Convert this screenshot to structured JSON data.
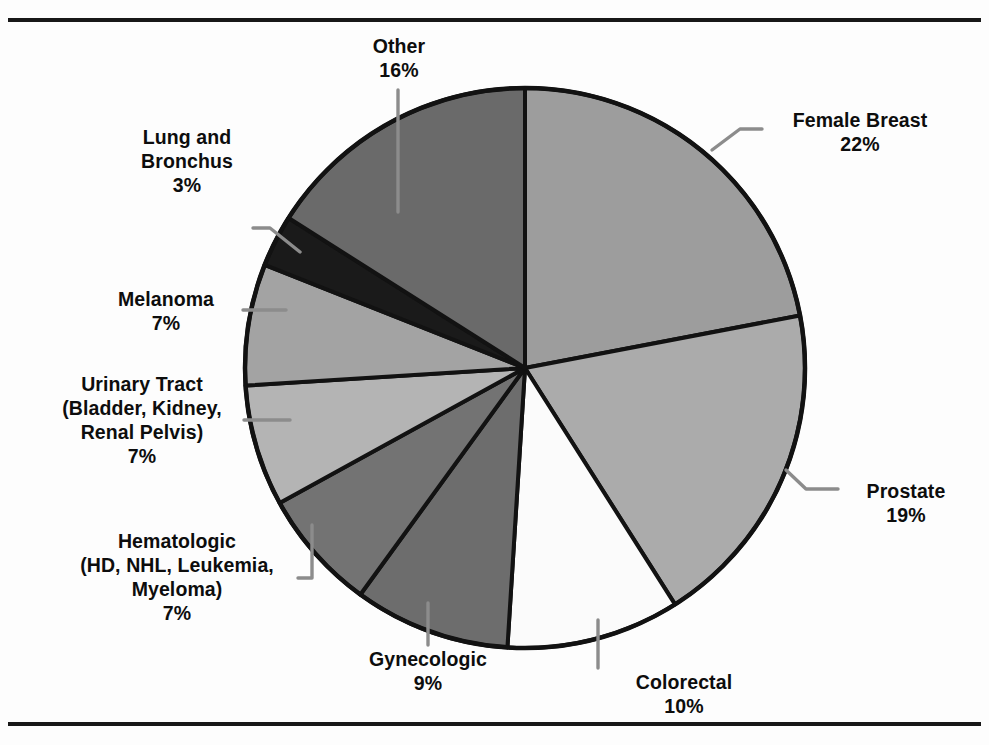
{
  "figure": {
    "frame_color": "#181818",
    "background": "#fdfdfd"
  },
  "chart_data": {
    "type": "pie",
    "title": "",
    "subtitle": "",
    "xlabel": "",
    "ylabel": "",
    "legend_position": "callout-labels",
    "grid": false,
    "units": "percent",
    "total": 100,
    "start_angle_deg": 0,
    "direction": "clockwise",
    "categories": [
      "Female Breast",
      "Prostate",
      "Colorectal",
      "Gynecologic",
      "Hematologic (HD, NHL, Leukemia, Myeloma)",
      "Urinary Tract (Bladder, Kidney, Renal Pelvis)",
      "Melanoma",
      "Lung and Bronchus",
      "Other"
    ],
    "values": [
      22,
      19,
      10,
      9,
      7,
      7,
      7,
      3,
      16
    ],
    "slices": [
      {
        "name": "Female Breast",
        "label_line1": "Female Breast",
        "label_line2": "",
        "label_line3": "",
        "percent_label": "22%",
        "value": 22,
        "fill": "#9d9d9d",
        "leader": true
      },
      {
        "name": "Prostate",
        "label_line1": "Prostate",
        "label_line2": "",
        "label_line3": "",
        "percent_label": "19%",
        "value": 19,
        "fill": "#ababab",
        "leader": true
      },
      {
        "name": "Colorectal",
        "label_line1": "Colorectal",
        "label_line2": "",
        "label_line3": "",
        "percent_label": "10%",
        "value": 10,
        "fill": "#fbfbfb",
        "leader": true
      },
      {
        "name": "Gynecologic",
        "label_line1": "Gynecologic",
        "label_line2": "",
        "label_line3": "",
        "percent_label": "9%",
        "value": 9,
        "fill": "#6d6d6d",
        "leader": true
      },
      {
        "name": "Hematologic",
        "label_line1": "Hematologic",
        "label_line2": "(HD, NHL, Leukemia,",
        "label_line3": "Myeloma)",
        "percent_label": "7%",
        "value": 7,
        "fill": "#737373",
        "leader": true
      },
      {
        "name": "Urinary Tract",
        "label_line1": "Urinary Tract",
        "label_line2": "(Bladder, Kidney,",
        "label_line3": "Renal Pelvis)",
        "percent_label": "7%",
        "value": 7,
        "fill": "#b4b4b4",
        "leader": true
      },
      {
        "name": "Melanoma",
        "label_line1": "Melanoma",
        "label_line2": "",
        "label_line3": "",
        "percent_label": "7%",
        "value": 7,
        "fill": "#a3a3a3",
        "leader": true
      },
      {
        "name": "Lung and Bronchus",
        "label_line1": "Lung and",
        "label_line2": "Bronchus",
        "label_line3": "",
        "percent_label": "3%",
        "value": 3,
        "fill": "#1a1a1a",
        "leader": true
      },
      {
        "name": "Other",
        "label_line1": "Other",
        "label_line2": "",
        "label_line3": "",
        "percent_label": "16%",
        "value": 16,
        "fill": "#6a6a6a",
        "leader": true
      }
    ]
  }
}
